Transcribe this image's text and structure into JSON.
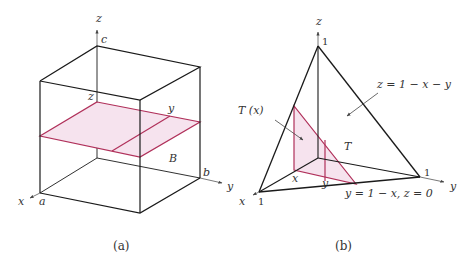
{
  "colors": {
    "edge": "#1a1a1a",
    "axis": "#555555",
    "highlight": "#b0305a",
    "highlight_fill": "#f6e3ee"
  },
  "panel_a": {
    "caption": "(a)",
    "axes": {
      "x": "x",
      "y": "y",
      "z": "z"
    },
    "bounds": {
      "a": "a",
      "b": "b",
      "c": "c"
    },
    "slice_labels": {
      "z": "z",
      "y": "y"
    },
    "region": "B"
  },
  "panel_b": {
    "caption": "(b)",
    "axes": {
      "x": "x",
      "y": "y",
      "z": "z"
    },
    "intercepts": {
      "x": "1",
      "y": "1",
      "z": "1"
    },
    "cross_section": "T (x)",
    "region": "T",
    "plane_eq": "z = 1 − x − y",
    "base_eq": "y = 1 − x,  z = 0",
    "slice_labels": {
      "x": "x",
      "y": "y"
    }
  }
}
